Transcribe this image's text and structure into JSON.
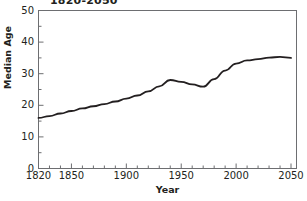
{
  "chart_data": {
    "type": "line",
    "title": "1820-2050",
    "xlabel": "Year",
    "ylabel": "Median Age",
    "xlim": [
      1820,
      2055
    ],
    "ylim": [
      0,
      50
    ],
    "grid": false,
    "legend": false,
    "x_ticks": [
      1820,
      1850,
      1900,
      1950,
      2000,
      2050
    ],
    "x_tick_labels": [
      "1820",
      "1850",
      "1900",
      "1950",
      "2000",
      "2050"
    ],
    "x_minor_ticks": [
      1830,
      1840,
      1860,
      1870,
      1880,
      1890,
      1910,
      1920,
      1930,
      1940,
      1960,
      1970,
      1980,
      1990,
      2010,
      2020,
      2030,
      2040
    ],
    "y_ticks": [
      0,
      10,
      20,
      30,
      40,
      50
    ],
    "y_tick_labels": [
      "0",
      "10",
      "20",
      "30",
      "40",
      "50"
    ],
    "y_minor_ticks": [
      5,
      15,
      25,
      35,
      45
    ],
    "line_color": "#231f20",
    "line_width": 1.8,
    "series": [
      {
        "name": "Median Age",
        "x": [
          1820,
          1830,
          1840,
          1850,
          1860,
          1870,
          1880,
          1890,
          1900,
          1910,
          1920,
          1930,
          1940,
          1950,
          1960,
          1970,
          1980,
          1990,
          2000,
          2010,
          2020,
          2030,
          2040,
          2050
        ],
        "values": [
          16.0,
          16.6,
          17.4,
          18.2,
          19.0,
          19.7,
          20.4,
          21.2,
          22.1,
          23.1,
          24.4,
          26.0,
          28.0,
          27.4,
          26.6,
          25.9,
          28.3,
          31.0,
          33.2,
          34.2,
          34.6,
          35.1,
          35.3,
          35.0
        ]
      }
    ]
  }
}
